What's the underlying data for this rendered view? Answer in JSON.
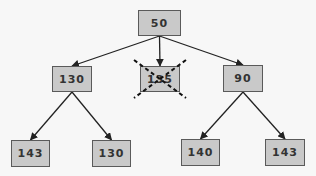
{
  "diagram": {
    "type": "tree",
    "colors": {
      "background": "#f7f7f7",
      "node_fill": "#c9c9c9",
      "node_border": "#5a5a5a",
      "edge": "#222222",
      "text": "#333333"
    },
    "nodes": [
      {
        "id": "root",
        "label": "50",
        "x": 138,
        "y": 10,
        "w": 43,
        "h": 26,
        "pruned": false
      },
      {
        "id": "l1_left",
        "label": "130",
        "x": 52,
        "y": 66,
        "w": 40,
        "h": 26,
        "pruned": false
      },
      {
        "id": "l1_mid",
        "label": "135",
        "x": 140,
        "y": 66,
        "w": 40,
        "h": 26,
        "pruned": true
      },
      {
        "id": "l1_right",
        "label": "90",
        "x": 223,
        "y": 65,
        "w": 40,
        "h": 27,
        "pruned": false
      },
      {
        "id": "leaf_1",
        "label": "143",
        "x": 11,
        "y": 140,
        "w": 39,
        "h": 27,
        "pruned": false
      },
      {
        "id": "leaf_2",
        "label": "130",
        "x": 92,
        "y": 140,
        "w": 39,
        "h": 27,
        "pruned": false
      },
      {
        "id": "leaf_3",
        "label": "140",
        "x": 181,
        "y": 139,
        "w": 39,
        "h": 27,
        "pruned": false
      },
      {
        "id": "leaf_4",
        "label": "143",
        "x": 265,
        "y": 139,
        "w": 40,
        "h": 27,
        "pruned": false
      }
    ],
    "edges": [
      {
        "from": "root",
        "to": "l1_left"
      },
      {
        "from": "root",
        "to": "l1_mid"
      },
      {
        "from": "root",
        "to": "l1_right"
      },
      {
        "from": "l1_left",
        "to": "leaf_1"
      },
      {
        "from": "l1_left",
        "to": "leaf_2"
      },
      {
        "from": "l1_right",
        "to": "leaf_3"
      },
      {
        "from": "l1_right",
        "to": "leaf_4"
      }
    ]
  }
}
